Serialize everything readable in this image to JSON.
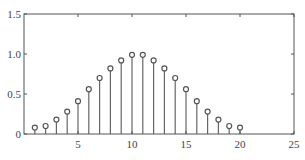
{
  "chart_data": {
    "type": "stem",
    "title": "",
    "xlabel": "",
    "ylabel": "",
    "xlim": [
      0,
      25
    ],
    "ylim": [
      0,
      1.5
    ],
    "xticks": [
      5,
      10,
      15,
      20,
      25
    ],
    "yticks": [
      0,
      0.5,
      1.0,
      1.5
    ],
    "xtick_labels": [
      "5",
      "10",
      "15",
      "20",
      "25"
    ],
    "ytick_labels": [
      "0",
      "0.5",
      "1.0",
      "1.5"
    ],
    "grid": false,
    "legend": null,
    "series": [
      {
        "name": "w(n)",
        "marker": "open-circle",
        "x": [
          1,
          2,
          3,
          4,
          5,
          6,
          7,
          8,
          9,
          10,
          11,
          12,
          13,
          14,
          15,
          16,
          17,
          18,
          19,
          20
        ],
        "values": [
          0.08,
          0.1,
          0.18,
          0.28,
          0.41,
          0.56,
          0.7,
          0.82,
          0.92,
          0.99,
          0.99,
          0.92,
          0.82,
          0.7,
          0.56,
          0.41,
          0.28,
          0.18,
          0.1,
          0.08
        ]
      }
    ],
    "colors": {
      "axis": "#555555",
      "stem": "#666666",
      "marker": "#555555"
    }
  }
}
